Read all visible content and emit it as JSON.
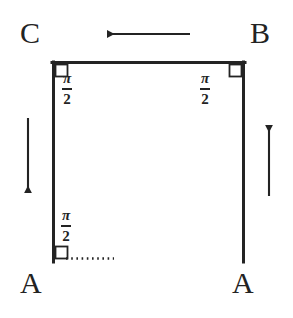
{
  "figure": {
    "background_color": "#ffffff",
    "stroke_color": "#232323",
    "width": 293,
    "height": 318
  },
  "vertices": [
    {
      "id": "C",
      "label": "C",
      "position": "top-left"
    },
    {
      "id": "B",
      "label": "B",
      "position": "top-right"
    },
    {
      "id": "A-left",
      "label": "A",
      "position": "bottom-left"
    },
    {
      "id": "A-right",
      "label": "A",
      "position": "bottom-right"
    }
  ],
  "angles": [
    {
      "id": "angle-top-left",
      "numerator": "π",
      "denominator": "2",
      "at_vertex": "C",
      "right_angle_marker": true
    },
    {
      "id": "angle-top-right",
      "numerator": "π",
      "denominator": "2",
      "at_vertex": "B",
      "right_angle_marker": true
    },
    {
      "id": "angle-bottom-left",
      "numerator": "π",
      "denominator": "2",
      "at_vertex": "A-left",
      "right_angle_marker": true
    }
  ],
  "edges": [
    {
      "id": "edge-top",
      "from": "C",
      "to": "B",
      "style": "solid",
      "orientation": "horizontal"
    },
    {
      "id": "edge-left",
      "from": "C",
      "to": "A-left",
      "style": "solid",
      "orientation": "vertical"
    },
    {
      "id": "edge-right",
      "from": "B",
      "to": "A-right",
      "style": "solid",
      "orientation": "vertical"
    },
    {
      "id": "edge-bottom-dotted",
      "from": "A-left",
      "to": "interior",
      "style": "dotted",
      "orientation": "horizontal"
    }
  ],
  "arrows": [
    {
      "id": "arrow-top",
      "direction": "left",
      "near_edge": "edge-top"
    },
    {
      "id": "arrow-left",
      "direction": "down",
      "near_edge": "edge-left"
    },
    {
      "id": "arrow-right",
      "direction": "up",
      "near_edge": "edge-right"
    }
  ]
}
